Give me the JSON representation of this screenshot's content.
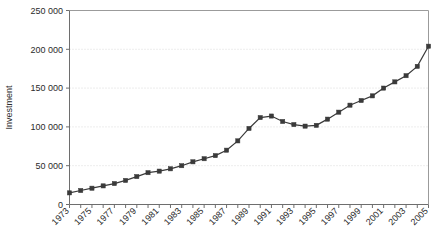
{
  "chart_data": {
    "type": "line",
    "title": "",
    "xlabel": "",
    "ylabel": "Investment",
    "ylim": [
      0,
      250000
    ],
    "xlim": [
      1973,
      2005
    ],
    "grid": true,
    "legend": null,
    "marker": "square",
    "line_color": "#3a3a3a",
    "grid_color": "#d2d2d2",
    "axis_color": "#6e6e6e",
    "y_ticks": [
      0,
      50000,
      100000,
      150000,
      200000,
      250000
    ],
    "y_tick_labels": [
      "0",
      "50 000",
      "100 000",
      "150 000",
      "200 000",
      "250 000"
    ],
    "x_tick_labels": [
      "1973",
      "1975",
      "1977",
      "1979",
      "1981",
      "1983",
      "1985",
      "1987",
      "1989",
      "1991",
      "1993",
      "1995",
      "1997",
      "1999",
      "2001",
      "2003",
      "2005"
    ],
    "x": [
      1973,
      1974,
      1975,
      1976,
      1977,
      1978,
      1979,
      1980,
      1981,
      1982,
      1983,
      1984,
      1985,
      1986,
      1987,
      1988,
      1989,
      1990,
      1991,
      1992,
      1993,
      1994,
      1995,
      1996,
      1997,
      1998,
      1999,
      2000,
      2001,
      2002,
      2003,
      2004,
      2005
    ],
    "values": [
      15000,
      18000,
      21000,
      24000,
      27000,
      31000,
      36000,
      41000,
      43000,
      46000,
      50000,
      55000,
      59000,
      63000,
      70000,
      82000,
      98000,
      112000,
      114000,
      107000,
      103000,
      101000,
      102000,
      110000,
      119000,
      128000,
      134000,
      140000,
      150000,
      158000,
      166000,
      178000,
      204000
    ]
  }
}
